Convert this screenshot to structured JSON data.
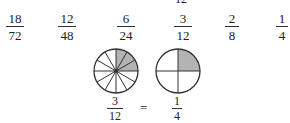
{
  "top_cutoff_text": "12",
  "fractions_row": [
    {
      "numerator": "18",
      "denominator": "72"
    },
    {
      "numerator": "12",
      "denominator": "48"
    },
    {
      "numerator": "6",
      "denominator": "24"
    },
    {
      "numerator": "3",
      "denominator": "12"
    },
    {
      "numerator": "2",
      "denominator": "8"
    },
    {
      "numerator": "1",
      "denominator": "4"
    }
  ],
  "diagram": {
    "left_circle": {
      "segments": 12,
      "shaded": 3,
      "fraction": {
        "numerator": "3",
        "denominator": "12"
      }
    },
    "equals": "=",
    "right_circle": {
      "segments": 4,
      "shaded": 1,
      "fraction": {
        "numerator": "1",
        "denominator": "4"
      }
    },
    "shade_color": "#b3b3b3",
    "stroke_color": "#333333"
  }
}
